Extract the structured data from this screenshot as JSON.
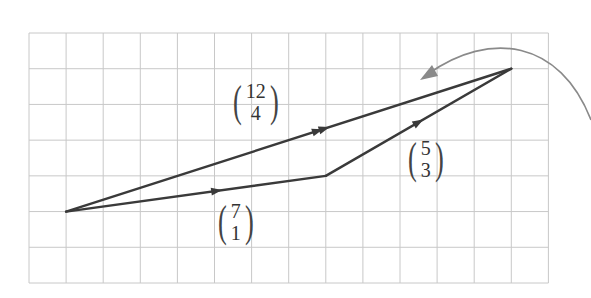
{
  "grid": {
    "x0": 29,
    "y0": 33,
    "cell": 37.1,
    "cols": 14,
    "rows": 7,
    "line_color": "#c8c8c8"
  },
  "points": {
    "start": {
      "gx": 1,
      "gy": 5
    },
    "mid": {
      "gx": 8,
      "gy": 4
    },
    "end": {
      "gx": 13,
      "gy": 1
    }
  },
  "vectors": [
    {
      "id": "a",
      "from": "start",
      "to": "mid",
      "top": "7",
      "bottom": "1",
      "label_x": 215,
      "label_y": 200
    },
    {
      "id": "b",
      "from": "mid",
      "to": "end",
      "top": "5",
      "bottom": "3",
      "label_x": 405,
      "label_y": 137
    },
    {
      "id": "sum",
      "from": "start",
      "to": "end",
      "top": "12",
      "bottom": "4",
      "label_x": 230,
      "label_y": 80
    }
  ],
  "colors": {
    "vector": "#3a3a3a",
    "curve": "#8a8a8a"
  }
}
